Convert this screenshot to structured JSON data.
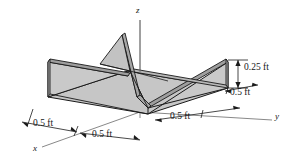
{
  "figure": {
    "object": "channel-section-beam",
    "projection": "isometric",
    "fill_color": "#c9c9c9",
    "flange_top_color": "#b4b4b4",
    "web_color": "#bdbdbd",
    "base_color": "#c4c4c4",
    "outline_color": "#1a1a1a",
    "axis_color": "#5a5a5a",
    "background": "#ffffff"
  },
  "axes": [
    {
      "name": "z-axis",
      "label": "z",
      "direction": "up"
    },
    {
      "name": "y-axis",
      "label": "y",
      "direction": "right-down"
    },
    {
      "name": "x-axis",
      "label": "x",
      "direction": "left-down"
    }
  ],
  "dimensions": [
    {
      "name": "height-dimension",
      "label": "0.25 ft",
      "value": 0.25,
      "unit": "ft",
      "orientation": "vertical",
      "location": "right-flange-height"
    },
    {
      "name": "right-flange-depth",
      "label": "0.5 ft",
      "value": 0.5,
      "unit": "ft",
      "orientation": "along-y",
      "location": "upper-right"
    },
    {
      "name": "y-span-dimension",
      "label": "0.5 ft",
      "value": 0.5,
      "unit": "ft",
      "orientation": "along-y",
      "location": "lower-right"
    },
    {
      "name": "x-span-dimension-outer",
      "label": "0.5 ft",
      "value": 0.5,
      "unit": "ft",
      "orientation": "along-x",
      "location": "lower-left"
    },
    {
      "name": "x-span-dimension-inner",
      "label": "0.5 ft",
      "value": 0.5,
      "unit": "ft",
      "orientation": "along-x",
      "location": "bottom-center"
    }
  ]
}
